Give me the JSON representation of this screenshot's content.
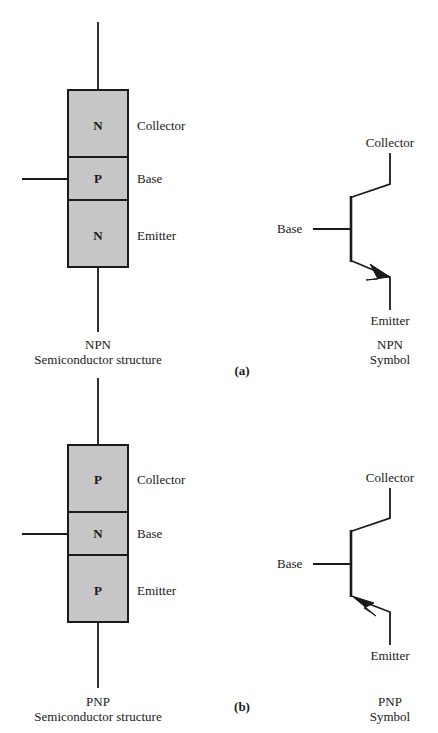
{
  "figure": {
    "panels": [
      {
        "tag": "(a)",
        "device": "NPN",
        "structure": {
          "caption_line1": "NPN",
          "caption_line2": "Semiconductor structure",
          "layers": [
            {
              "doping": "N",
              "terminal": "Collector"
            },
            {
              "doping": "P",
              "terminal": "Base"
            },
            {
              "doping": "N",
              "terminal": "Emitter"
            }
          ]
        },
        "symbol": {
          "caption_line1": "NPN",
          "caption_line2": "Symbol",
          "collector_label": "Collector",
          "base_label": "Base",
          "emitter_label": "Emitter",
          "arrow_direction": "out-of-base (pointing away from base bar)"
        }
      },
      {
        "tag": "(b)",
        "device": "PNP",
        "structure": {
          "caption_line1": "PNP",
          "caption_line2": "Semiconductor structure",
          "layers": [
            {
              "doping": "P",
              "terminal": "Collector"
            },
            {
              "doping": "N",
              "terminal": "Base"
            },
            {
              "doping": "P",
              "terminal": "Emitter"
            }
          ]
        },
        "symbol": {
          "caption_line1": "PNP",
          "caption_line2": "Symbol",
          "collector_label": "Collector",
          "base_label": "Base",
          "emitter_label": "Emitter",
          "arrow_direction": "into-base (pointing toward base bar)"
        }
      }
    ]
  },
  "colors": {
    "page_background": "#ffffff",
    "layer_fill": "#c6c6c6",
    "stroke": "#1a1a1a",
    "text": "#1a1a1a"
  }
}
